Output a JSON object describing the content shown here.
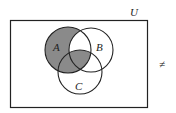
{
  "diagram": {
    "type": "venn",
    "universe_label": "U",
    "sets": [
      {
        "name": "A",
        "label": "A"
      },
      {
        "name": "B",
        "label": "B"
      },
      {
        "name": "C",
        "label": "C"
      }
    ],
    "shaded_regions": [
      "A only",
      "A∩C only",
      "A∩B∩C"
    ],
    "side_symbol": "≠",
    "colors": {
      "shade": "#8a8a8a",
      "stroke": "#222222",
      "background": "#ffffff"
    }
  }
}
